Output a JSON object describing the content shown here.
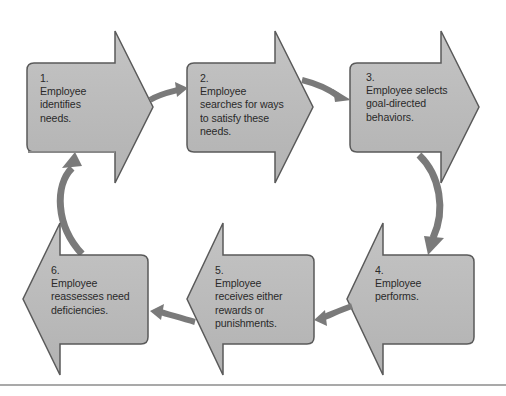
{
  "diagram": {
    "type": "cycle",
    "colors": {
      "shape_fill": "#b4b4b4",
      "shape_fill_light": "#c6c6c6",
      "shape_outline": "#5a5a5a",
      "connector": "#7a7a7a",
      "rule": "#a9a9a9",
      "background": "#ffffff"
    },
    "steps": [
      {
        "number": "1.",
        "lines": [
          "Employee",
          "identifies",
          "needs."
        ],
        "direction": "right"
      },
      {
        "number": "2.",
        "lines": [
          "Employee",
          "searches for ways",
          "to satisfy these",
          "needs."
        ],
        "direction": "right"
      },
      {
        "number": "3.",
        "lines": [
          "Employee selects",
          "goal-directed",
          "behaviors."
        ],
        "direction": "right"
      },
      {
        "number": "4.",
        "lines": [
          "Employee",
          "performs."
        ],
        "direction": "left"
      },
      {
        "number": "5.",
        "lines": [
          "Employee",
          "receives either",
          "rewards or",
          "punishments."
        ],
        "direction": "left"
      },
      {
        "number": "6.",
        "lines": [
          "Employee",
          "reassesses need",
          "deficiencies."
        ],
        "direction": "left"
      }
    ],
    "connectors": [
      {
        "from": 1,
        "to": 2,
        "icon": "curved-arrow-icon"
      },
      {
        "from": 2,
        "to": 3,
        "icon": "curved-arrow-icon"
      },
      {
        "from": 3,
        "to": 4,
        "icon": "curved-arrow-icon"
      },
      {
        "from": 4,
        "to": 5,
        "icon": "curved-arrow-icon"
      },
      {
        "from": 5,
        "to": 6,
        "icon": "curved-arrow-icon"
      },
      {
        "from": 6,
        "to": 1,
        "icon": "curved-arrow-icon"
      }
    ]
  }
}
